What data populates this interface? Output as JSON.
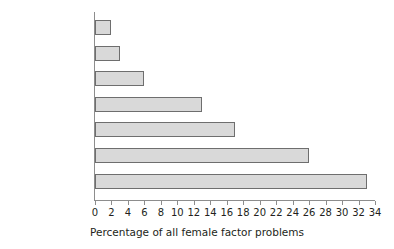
{
  "chart_data": {
    "type": "bar",
    "orientation": "horizontal",
    "title": "",
    "xlabel": "Percentage of all female factor problems",
    "ylabel": "",
    "categories": [
      "Vaginal",
      "Cervical",
      "Endometriosis",
      "Uterine",
      "Unexplained",
      "Tubal",
      "Ovulatory"
    ],
    "values": [
      2,
      3,
      6,
      13,
      17,
      26,
      33
    ],
    "xlim": [
      0,
      34
    ],
    "xticks": [
      0,
      2,
      4,
      6,
      8,
      10,
      12,
      14,
      16,
      18,
      20,
      22,
      24,
      26,
      28,
      30,
      32,
      34
    ],
    "xtick_labels": [
      "0",
      "2",
      "4",
      "6",
      "8",
      "10",
      "12",
      "14",
      "16",
      "18",
      "20",
      "22",
      "24",
      "26",
      "28",
      "30",
      "32",
      "34"
    ],
    "grid": false,
    "legend": null,
    "bar_fill_color": "#d9d9d9",
    "bar_border_color": "#6e6e6e",
    "axis_color": "#8d8d8d",
    "text_color": "#231f20"
  }
}
